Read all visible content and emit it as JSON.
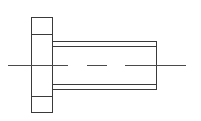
{
  "diagram": {
    "type": "technical-drawing",
    "colors": {
      "background": "#ffffff",
      "line": "#3a3a3a",
      "centerline": "#4a4a4a"
    },
    "flange": {
      "x": 31,
      "y": 17,
      "width": 21,
      "height": 95,
      "inner_top_y": 34,
      "inner_bottom_y": 96
    },
    "shaft": {
      "x": 52,
      "y": 41,
      "width": 104,
      "height": 48,
      "inner_top_y": 46,
      "inner_bottom_y": 84
    },
    "centerline": {
      "y": 65,
      "segments": [
        [
          8,
          68
        ],
        [
          87,
          107
        ],
        [
          125,
          186
        ]
      ]
    }
  }
}
